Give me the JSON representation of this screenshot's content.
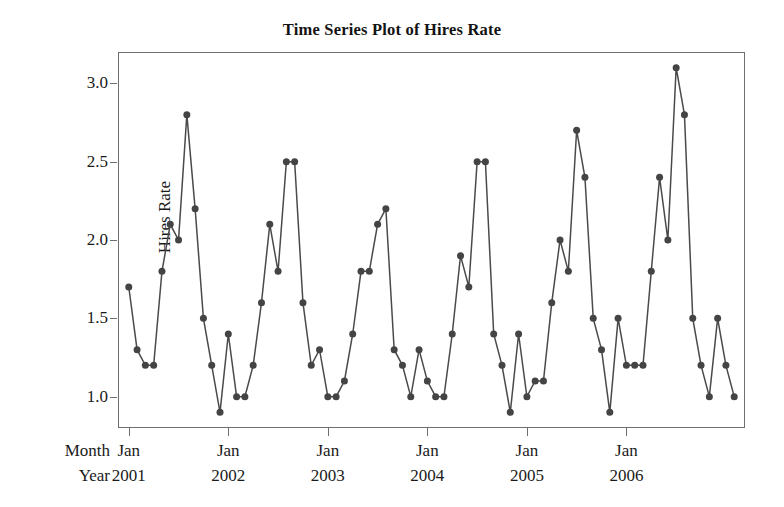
{
  "chart_data": {
    "type": "line",
    "title": "Time Series Plot of Hires Rate",
    "xlabel": "",
    "ylabel": "Hires Rate",
    "ylim": [
      0.8,
      3.2
    ],
    "yticks": [
      "1.0",
      "1.5",
      "2.0",
      "2.5",
      "3.0"
    ],
    "ytick_values": [
      1.0,
      1.5,
      2.0,
      2.5,
      3.0
    ],
    "grid": false,
    "legend": "none",
    "marker": "filled-circle",
    "line_color": "#4a4a4a",
    "marker_color": "#444444",
    "axis_row_labels": [
      "Month",
      "Year"
    ],
    "xtick_month_labels": [
      "Jan",
      "Jan",
      "Jan",
      "Jan",
      "Jan",
      "Jan"
    ],
    "xtick_year_labels": [
      "2001",
      "2002",
      "2003",
      "2004",
      "2005",
      "2006"
    ],
    "x_index": [
      1,
      2,
      3,
      4,
      5,
      6,
      7,
      8,
      9,
      10,
      11,
      12,
      13,
      14,
      15,
      16,
      17,
      18,
      19,
      20,
      21,
      22,
      23,
      24,
      25,
      26,
      27,
      28,
      29,
      30,
      31,
      32,
      33,
      34,
      35,
      36,
      37,
      38,
      39,
      40,
      41,
      42,
      43,
      44,
      45,
      46,
      47,
      48,
      49,
      50,
      51,
      52,
      53,
      54,
      55,
      56,
      57,
      58,
      59,
      60,
      61,
      62,
      63,
      64,
      65,
      66,
      67,
      68,
      69,
      70,
      71,
      72,
      73,
      74
    ],
    "values": [
      1.7,
      1.3,
      1.2,
      1.2,
      1.8,
      2.1,
      2.0,
      2.8,
      2.2,
      1.5,
      1.2,
      0.9,
      1.4,
      1.0,
      1.0,
      1.2,
      1.6,
      2.1,
      1.8,
      2.5,
      2.5,
      1.6,
      1.2,
      1.3,
      1.0,
      1.0,
      1.1,
      1.4,
      1.8,
      1.8,
      2.1,
      2.2,
      1.3,
      1.2,
      1.0,
      1.3,
      1.1,
      1.0,
      1.0,
      1.4,
      1.9,
      1.7,
      2.5,
      2.5,
      1.4,
      1.2,
      0.9,
      1.4,
      1.0,
      1.1,
      1.1,
      1.6,
      2.0,
      1.8,
      2.7,
      2.4,
      1.5,
      1.3,
      0.9,
      1.5,
      1.2,
      1.2,
      1.2,
      1.8,
      2.4,
      2.0,
      3.1,
      2.8,
      1.5,
      1.2,
      1.0,
      1.5,
      1.2,
      1.0
    ]
  }
}
